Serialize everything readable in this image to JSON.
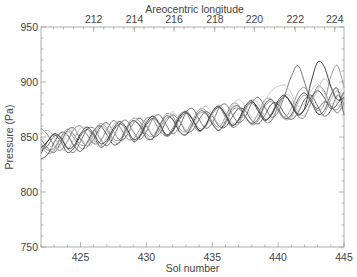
{
  "chart_data": {
    "type": "line",
    "title": "",
    "xlabel": "Sol number",
    "ylabel": "Pressure (Pa)",
    "top_xlabel": "Areocentric longitude",
    "xlim": [
      422,
      445
    ],
    "ylim": [
      750,
      950
    ],
    "x_ticks": [
      425,
      430,
      435,
      440,
      445
    ],
    "x_tick_labels": [
      "425",
      "430",
      "435",
      "440",
      "445"
    ],
    "y_ticks": [
      750,
      800,
      850,
      900,
      950
    ],
    "y_tick_labels": [
      "750",
      "800",
      "850",
      "900",
      "950"
    ],
    "top_ticks_sol": [
      422.9,
      426.0,
      429.1,
      432.1,
      435.2,
      438.2,
      441.3,
      444.3
    ],
    "top_tick_labels": [
      "212",
      "214",
      "216",
      "218",
      "220",
      "222",
      "224"
    ],
    "top_tick_label_sols": [
      426.0,
      429.1,
      432.1,
      435.2,
      438.2,
      441.3,
      444.3
    ],
    "grid": false,
    "legend": "none",
    "x": [
      422,
      422.5,
      423,
      423.5,
      424,
      424.5,
      425,
      425.5,
      426,
      426.5,
      427,
      427.5,
      428,
      428.5,
      429,
      429.5,
      430,
      430.5,
      431,
      431.5,
      432,
      432.5,
      433,
      433.5,
      434,
      434.5,
      435,
      435.5,
      436,
      436.5,
      437,
      437.5,
      438,
      438.5,
      439,
      439.5,
      440,
      440.5,
      441,
      441.5,
      442,
      442.5,
      443,
      443.5,
      444,
      444.5,
      445
    ],
    "series": [
      {
        "name": "trace-1",
        "color": "#3a3a3a",
        "values": [
          835,
          846,
          852,
          846,
          836,
          840,
          851,
          857,
          851,
          841,
          845,
          856,
          862,
          856,
          846,
          850,
          861,
          867,
          861,
          851,
          855,
          866,
          872,
          866,
          856,
          860,
          871,
          877,
          871,
          861,
          865,
          876,
          882,
          876,
          866,
          870,
          881,
          887,
          881,
          871,
          875,
          886,
          892,
          886,
          876,
          880,
          891
        ]
      },
      {
        "name": "trace-2",
        "color": "#555555",
        "values": [
          848,
          840,
          836,
          845,
          856,
          858,
          848,
          842,
          848,
          859,
          863,
          855,
          847,
          851,
          862,
          867,
          860,
          851,
          853,
          864,
          870,
          865,
          855,
          856,
          866,
          873,
          869,
          860,
          859,
          868,
          876,
          874,
          865,
          862,
          870,
          880,
          880,
          871,
          866,
          872,
          884,
          888,
          878,
          869,
          874,
          888,
          880
        ]
      },
      {
        "name": "trace-3",
        "color": "#7a7a7a",
        "values": [
          858,
          852,
          842,
          838,
          846,
          857,
          860,
          852,
          844,
          846,
          857,
          865,
          859,
          849,
          848,
          857,
          867,
          866,
          856,
          851,
          858,
          870,
          872,
          862,
          855,
          860,
          872,
          877,
          868,
          859,
          862,
          875,
          881,
          873,
          864,
          865,
          878,
          887,
          880,
          869,
          868,
          882,
          896,
          892,
          878,
          875,
          886
        ]
      },
      {
        "name": "trace-4",
        "color": "#999999",
        "values": [
          842,
          835,
          838,
          849,
          855,
          849,
          840,
          841,
          852,
          860,
          856,
          846,
          845,
          856,
          864,
          861,
          851,
          848,
          857,
          867,
          866,
          856,
          852,
          860,
          871,
          871,
          862,
          856,
          862,
          874,
          876,
          868,
          861,
          865,
          878,
          882,
          874,
          866,
          868,
          881,
          888,
          882,
          872,
          871,
          884,
          892,
          884
        ]
      },
      {
        "name": "trace-5",
        "color": "#444444",
        "values": [
          830,
          834,
          845,
          854,
          852,
          842,
          837,
          845,
          856,
          860,
          852,
          843,
          846,
          858,
          865,
          860,
          849,
          849,
          860,
          869,
          866,
          855,
          852,
          862,
          873,
          872,
          862,
          856,
          864,
          876,
          878,
          869,
          862,
          867,
          880,
          884,
          876,
          867,
          870,
          884,
          890,
          882,
          871,
          874,
          888,
          894,
          870
        ]
      },
      {
        "name": "trace-6",
        "color": "#b5b5b5",
        "values": [
          853,
          856,
          850,
          840,
          838,
          848,
          858,
          858,
          848,
          842,
          850,
          861,
          864,
          855,
          847,
          853,
          865,
          869,
          861,
          852,
          856,
          868,
          874,
          867,
          858,
          859,
          871,
          879,
          873,
          863,
          862,
          874,
          884,
          880,
          868,
          866,
          877,
          888,
          886,
          873,
          870,
          881,
          893,
          903,
          895,
          880,
          878
        ]
      },
      {
        "name": "trace-7",
        "color": "#666666",
        "values": [
          838,
          842,
          851,
          850,
          840,
          836,
          846,
          857,
          858,
          848,
          842,
          850,
          862,
          865,
          855,
          848,
          855,
          867,
          870,
          861,
          853,
          859,
          872,
          876,
          866,
          858,
          863,
          876,
          880,
          871,
          863,
          868,
          881,
          886,
          877,
          868,
          873,
          888,
          905,
          915,
          900,
          882,
          876,
          882,
          878,
          872,
          880
        ]
      },
      {
        "name": "trace-8",
        "color": "#8a8a8a",
        "values": [
          844,
          838,
          840,
          850,
          857,
          852,
          843,
          844,
          855,
          862,
          858,
          848,
          848,
          859,
          867,
          864,
          853,
          851,
          861,
          871,
          869,
          858,
          855,
          865,
          875,
          874,
          864,
          859,
          868,
          880,
          879,
          868,
          863,
          872,
          884,
          884,
          874,
          868,
          876,
          890,
          895,
          885,
          874,
          880,
          905,
          915,
          895
        ]
      },
      {
        "name": "trace-9",
        "color": "#c4c4c4",
        "values": [
          850,
          845,
          838,
          842,
          853,
          857,
          850,
          842,
          845,
          857,
          862,
          855,
          846,
          850,
          862,
          868,
          861,
          852,
          855,
          867,
          873,
          866,
          857,
          860,
          872,
          878,
          871,
          862,
          865,
          878,
          884,
          878,
          868,
          870,
          883,
          892,
          896,
          897,
          890,
          878,
          880,
          892,
          898,
          890,
          880,
          886,
          897
        ]
      },
      {
        "name": "trace-10",
        "color": "#2f2f2f",
        "values": [
          840,
          846,
          853,
          849,
          840,
          842,
          853,
          859,
          853,
          844,
          847,
          858,
          864,
          858,
          848,
          851,
          863,
          869,
          862,
          852,
          856,
          868,
          873,
          866,
          856,
          861,
          873,
          878,
          870,
          860,
          866,
          878,
          883,
          874,
          865,
          871,
          883,
          888,
          880,
          870,
          876,
          900,
          918,
          914,
          896,
          884,
          886
        ]
      }
    ]
  }
}
